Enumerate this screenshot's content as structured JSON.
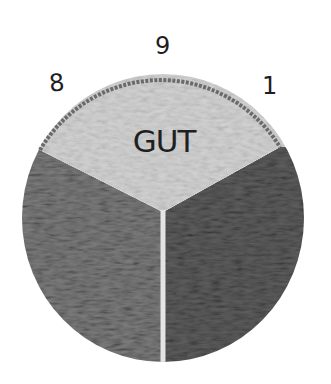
{
  "diagram": {
    "type": "pie-dial",
    "style": "hand-drawn, textured grayscale",
    "labels": {
      "top": "9",
      "left": "8",
      "right": "1"
    },
    "sectors": [
      {
        "name": "top",
        "label": "GUT",
        "color": "#d4d4d4"
      },
      {
        "name": "bottom-left",
        "label": "",
        "color": "#7d7d7d"
      },
      {
        "name": "bottom-right",
        "label": "",
        "color": "#5e5e5e"
      }
    ],
    "colors": {
      "rim": "#6a6a6a",
      "divider": "#e4e4e4",
      "ink": "#1e1e1e"
    }
  }
}
